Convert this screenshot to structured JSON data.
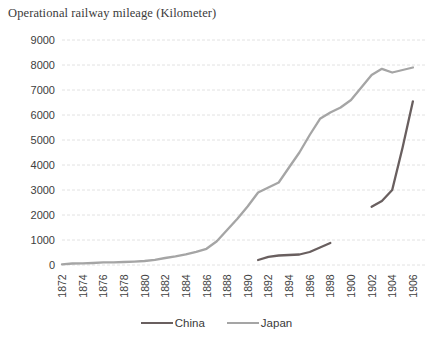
{
  "title": "Operational railway mileage (Kilometer)",
  "legend": {
    "items": [
      {
        "label": "China"
      },
      {
        "label": "Japan"
      }
    ]
  },
  "chart_data": {
    "type": "line",
    "title": "Operational railway mileage (Kilometer)",
    "xlabel": "",
    "ylabel": "",
    "ylim": [
      0,
      9000
    ],
    "y_tick_step": 1000,
    "grid": "horizontal-dashed",
    "grid_color": "#e2e2e2",
    "legend_position": "bottom",
    "x": [
      1872,
      1873,
      1874,
      1875,
      1876,
      1877,
      1878,
      1879,
      1880,
      1881,
      1882,
      1883,
      1884,
      1885,
      1886,
      1887,
      1888,
      1889,
      1890,
      1891,
      1892,
      1893,
      1894,
      1895,
      1896,
      1897,
      1898,
      1899,
      1900,
      1901,
      1902,
      1903,
      1904,
      1905,
      1906
    ],
    "xticks": [
      1872,
      1874,
      1876,
      1878,
      1880,
      1882,
      1884,
      1886,
      1888,
      1890,
      1892,
      1894,
      1896,
      1898,
      1900,
      1902,
      1904,
      1906
    ],
    "yticks": [
      9000,
      8000,
      7000,
      6000,
      5000,
      4000,
      3000,
      2000,
      1000,
      0
    ],
    "series": [
      {
        "name": "China",
        "color": "#695f5f",
        "values": [
          null,
          null,
          null,
          null,
          null,
          null,
          null,
          null,
          null,
          null,
          null,
          null,
          null,
          null,
          null,
          null,
          null,
          null,
          null,
          200,
          330,
          380,
          400,
          420,
          520,
          700,
          880,
          null,
          null,
          null,
          2330,
          2560,
          3000,
          4700,
          6550
        ]
      },
      {
        "name": "Japan",
        "color": "#a5a5a5",
        "values": [
          29,
          60,
          65,
          80,
          105,
          110,
          120,
          135,
          160,
          210,
          280,
          350,
          430,
          530,
          650,
          950,
          1400,
          1850,
          2350,
          2900,
          3100,
          3300,
          3900,
          4500,
          5200,
          5850,
          6100,
          6300,
          6600,
          7100,
          7600,
          7850,
          7700,
          7800,
          7900
        ]
      }
    ]
  }
}
